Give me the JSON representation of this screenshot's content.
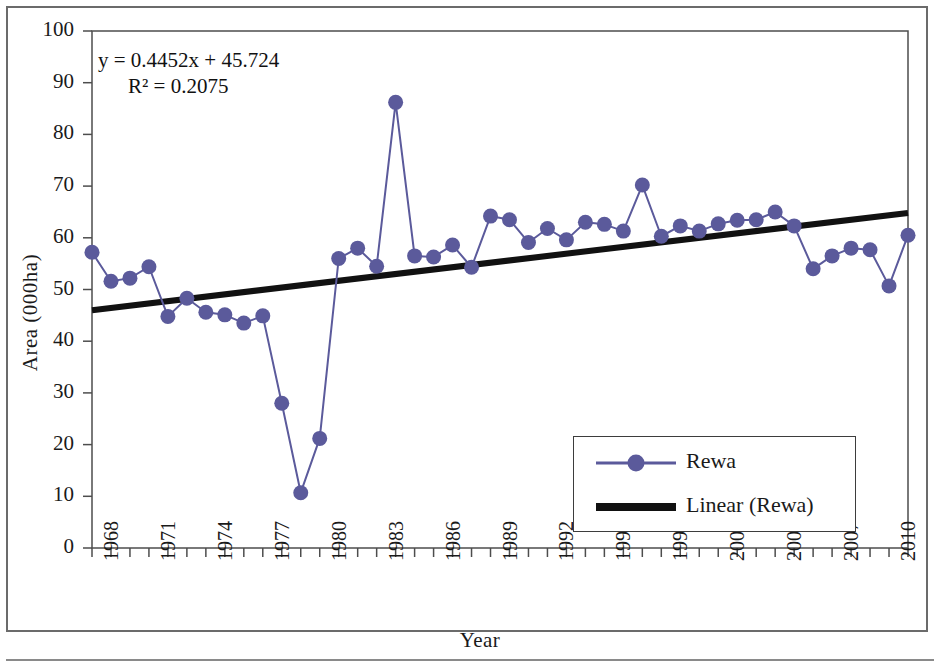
{
  "chart_data": {
    "type": "line",
    "title": "",
    "xlabel": "Year",
    "ylabel": "Area (000ha)",
    "ylim": [
      0,
      100
    ],
    "ytick_step": 10,
    "yticks": [
      0,
      10,
      20,
      30,
      40,
      50,
      60,
      70,
      80,
      90,
      100
    ],
    "xlim": [
      1968,
      2011
    ],
    "xticks_labeled": [
      1968,
      1971,
      1974,
      1977,
      1980,
      1983,
      1986,
      1989,
      1992,
      1995,
      1998,
      2001,
      2004,
      2007,
      2010
    ],
    "grid": false,
    "legend_position": "inside-bottom-right",
    "annotations": {
      "equation": "y = 0.4452x + 45.724",
      "r_squared": "R² = 0.2075",
      "slope": 0.4452,
      "intercept": 45.724,
      "r2_value": 0.2075
    },
    "x": [
      1968,
      1969,
      1970,
      1971,
      1972,
      1973,
      1974,
      1975,
      1976,
      1977,
      1978,
      1979,
      1980,
      1981,
      1982,
      1983,
      1984,
      1985,
      1986,
      1987,
      1988,
      1989,
      1990,
      1991,
      1992,
      1993,
      1994,
      1995,
      1996,
      1997,
      1998,
      1999,
      2000,
      2001,
      2002,
      2003,
      2004,
      2005,
      2006,
      2007,
      2008,
      2009,
      2010,
      2011
    ],
    "series": [
      {
        "name": "Rewa",
        "color": "#5b5a9b",
        "marker": "circle",
        "values": [
          57.2,
          51.6,
          52.2,
          54.4,
          44.8,
          48.3,
          45.6,
          45.1,
          43.5,
          44.9,
          28.0,
          10.7,
          21.2,
          56.0,
          58.0,
          54.5,
          86.2,
          56.5,
          56.3,
          58.6,
          54.3,
          64.2,
          63.5,
          59.1,
          61.8,
          59.6,
          63.0,
          62.6,
          61.3,
          70.2,
          60.3,
          62.3,
          61.3,
          62.7,
          63.4,
          63.5,
          65.0,
          62.3,
          54.0,
          56.5,
          58.0,
          57.7,
          50.7,
          60.5
        ]
      },
      {
        "name": "Linear (Rewa)",
        "color": "#111111",
        "type": "trendline",
        "endpoints": [
          {
            "x": 1968,
            "y": 46.0
          },
          {
            "x": 2011,
            "y": 64.8
          }
        ]
      }
    ]
  },
  "legend": {
    "items": [
      {
        "label": "Rewa",
        "swatch": "line-with-circle-marker"
      },
      {
        "label": "Linear (Rewa)",
        "swatch": "thick-black-line"
      }
    ]
  }
}
